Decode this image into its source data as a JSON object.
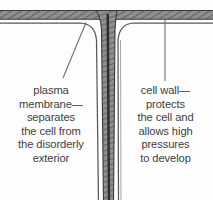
{
  "figure": {
    "type": "biology-diagram",
    "background_color": "#fdfdfd",
    "wall_fill_color": "#8c8c8c",
    "wall_hatch_color": "#5e5e5e",
    "wall_outline_color": "#3a3a3a",
    "membrane_line_color": "#555555",
    "leader_line_color": "#6b6b6b",
    "text_color": "#3d3d3d",
    "structures": [
      {
        "name": "horizontal-cell-wall",
        "description": "hatched horizontal band across the top of the figure"
      },
      {
        "name": "vertical-cell-wall",
        "description": "hatched vertical band descending from the T-junction to the bottom edge"
      },
      {
        "name": "plasma-membrane-left",
        "description": "thin line tracing the inside of the left cell"
      },
      {
        "name": "plasma-membrane-right",
        "description": "thin line tracing the inside of the right cell"
      }
    ]
  },
  "labels": {
    "left": {
      "target": "plasma-membrane",
      "lines": [
        "plasma",
        "membrane—",
        "separates",
        "the cell from",
        "the disorderly",
        "exterior"
      ],
      "full_text": "plasma membrane—separates the cell from the disorderly exterior",
      "leader_line": {
        "from_x": 63,
        "from_y": 77,
        "to_x": 86,
        "to_y": 22
      }
    },
    "right": {
      "target": "cell-wall",
      "lines": [
        "cell wall—",
        "protects",
        "the cell and",
        "allows high",
        "pressures",
        "to develop"
      ],
      "full_text": "cell wall—protects the cell and allows high pressures to develop",
      "leader_line": {
        "from_x": 165,
        "from_y": 80,
        "to_x": 165,
        "to_y": 18
      }
    }
  }
}
